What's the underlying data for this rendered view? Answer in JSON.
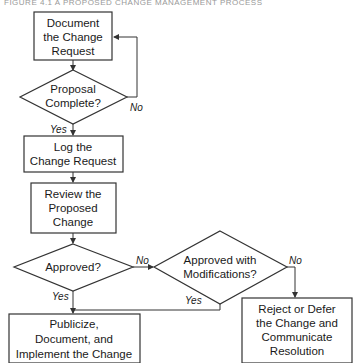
{
  "title": "FIGURE 4.1 A PROPOSED CHANGE MANAGEMENT PROCESS",
  "colors": {
    "stroke": "#333333",
    "fill": "#ffffff",
    "text": "#1a1a1a"
  },
  "nodes": {
    "document": {
      "type": "process",
      "lines": [
        "Document",
        "the Change",
        "Request"
      ]
    },
    "complete": {
      "type": "decision",
      "lines": [
        "Proposal",
        "Complete?"
      ]
    },
    "log": {
      "type": "process",
      "lines": [
        "Log the",
        "Change Request"
      ]
    },
    "review": {
      "type": "process",
      "lines": [
        "Review the",
        "Proposed",
        "Change"
      ]
    },
    "approved": {
      "type": "decision",
      "lines": [
        "Approved?"
      ]
    },
    "approved_mod": {
      "type": "decision",
      "lines": [
        "Approved with",
        "Modifications?"
      ]
    },
    "publicize": {
      "type": "process",
      "lines": [
        "Publicize,",
        "Document, and",
        "Implement the Change"
      ]
    },
    "reject": {
      "type": "process",
      "lines": [
        "Reject or Defer",
        "the Change and",
        "Communicate",
        "Resolution"
      ]
    }
  },
  "edges": {
    "complete_no": "No",
    "complete_yes": "Yes",
    "approved_no": "No",
    "approved_yes": "Yes",
    "approved_mod_no": "No",
    "approved_mod_yes": "Yes"
  }
}
